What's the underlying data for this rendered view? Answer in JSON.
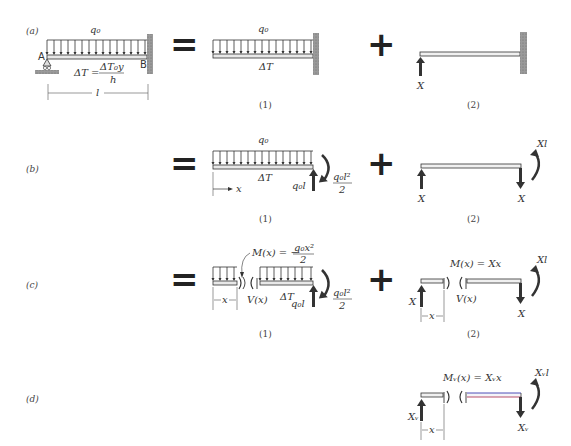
{
  "rows": [
    {
      "label": "(a)"
    },
    {
      "label": "(b)"
    },
    {
      "label": "(c)"
    },
    {
      "label": "(d)"
    }
  ],
  "row_a": {
    "load": "q₀",
    "support_left": "A",
    "support_right": "B",
    "temp_lhs": "ΔT =",
    "temp_num": "ΔT₀y",
    "temp_den": "h",
    "length": "l",
    "op_equals": "=",
    "op_plus": "+",
    "case1_load": "q₀",
    "case1_temp": "ΔT",
    "case1_caption": "(1)",
    "case2_force": "X",
    "case2_caption": "(2)"
  },
  "row_b": {
    "op_equals": "=",
    "op_plus": "+",
    "case1_load": "q₀",
    "case1_temp": "ΔT",
    "case1_axis": "x",
    "case1_reaction": "q₀l",
    "case1_moment_num": "q₀l²",
    "case1_moment_den": "2",
    "case1_caption": "(1)",
    "case2_force_left": "X",
    "case2_force_right": "X",
    "case2_moment": "Xl",
    "case2_caption": "(2)"
  },
  "row_c": {
    "op_equals": "=",
    "op_plus": "+",
    "case1_moment_lhs": "M(x) = −",
    "case1_moment_num": "q₀x²",
    "case1_moment_den": "2",
    "case1_shear": "V(x)",
    "case1_temp": "ΔT",
    "case1_dim": "x",
    "case1_reaction": "q₀l",
    "case1_end_moment_num": "q₀l²",
    "case1_end_moment_den": "2",
    "case1_caption": "(1)",
    "case2_moment_eq": "M(x) = Xx",
    "case2_shear": "V(x)",
    "case2_force_left": "X",
    "case2_force_right": "X",
    "case2_dim": "x",
    "case2_moment": "Xl",
    "case2_caption": "(2)"
  },
  "row_d": {
    "moment_eq": "Mᵥ(x) = Xᵥx",
    "force_left": "Xᵥ",
    "force_right": "Xᵥ",
    "moment": "Xᵥl",
    "dim": "x"
  },
  "colors": {
    "ink": "#222222",
    "wall": "#8a8a8a",
    "beam_fill": "#e8e8e8",
    "virtual_beam_top": "#3b3bb0",
    "virtual_beam_bottom": "#b03b5a"
  }
}
